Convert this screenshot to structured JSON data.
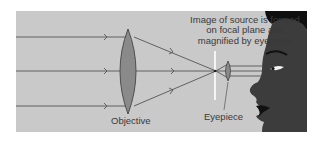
{
  "diagram": {
    "caption_lines": [
      "Image of source is formed",
      "on focal plane and",
      "magnified by eyepiece"
    ],
    "labels": {
      "objective": "Objective",
      "eyepiece": "Eyepiece"
    },
    "colors": {
      "panel": "#c9c9c9",
      "ray": "#555555",
      "lens_fill": "#8a8a8a",
      "lens_stroke": "#444444",
      "focal_plane": "#ffffff",
      "face": "#3c3c3c",
      "hair": "#0f0f0f"
    },
    "elements": [
      {
        "name": "incoming-ray",
        "count": 3
      },
      {
        "name": "objective-lens"
      },
      {
        "name": "focal-plane"
      },
      {
        "name": "eyepiece-lens"
      },
      {
        "name": "observer-face"
      }
    ]
  }
}
